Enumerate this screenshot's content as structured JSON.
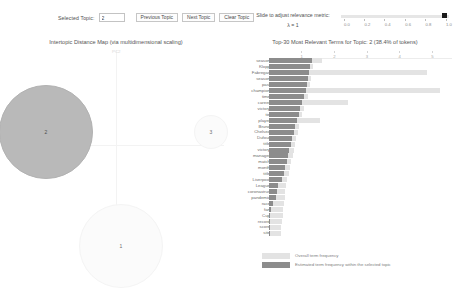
{
  "controls": {
    "selected_topic_label": "Selected Topic:",
    "selected_topic_value": "2",
    "previous_topic_label": "Previous Topic",
    "next_topic_label": "Next Topic",
    "clear_topic_label": "Clear Topic"
  },
  "lambda": {
    "title": "Slide to adjust relevance metric:",
    "value_label": "λ = 1",
    "ticks": [
      "0.0",
      "0.2",
      "0.4",
      "0.6",
      "0.8",
      "1.0"
    ],
    "handle_position": 1.0,
    "min": 0.0,
    "max": 1.0
  },
  "left_panel": {
    "title": "Intertopic Distance Map (via multidimensional scaling)",
    "axis_x_label": "PC1",
    "axis_y_label": "PC2",
    "topics": [
      {
        "id": "2",
        "x": 38,
        "y": 82,
        "r": 47,
        "selected": true
      },
      {
        "id": "1",
        "x": 113,
        "y": 196,
        "r": 42,
        "selected": false
      },
      {
        "id": "3",
        "x": 203,
        "y": 82,
        "r": 17,
        "selected": false
      }
    ]
  },
  "right_panel": {
    "title": "Top-30 Most Relevant Terms for Topic: 2 (38.4% of tokens)",
    "axis_ticks": [
      "1",
      "2",
      "3",
      "4",
      "5"
    ],
    "axis_max": 5.6,
    "legend": {
      "overall_label": "Overall term frequency",
      "topic_label": "Estimated term frequency within the selected topic",
      "overall_color": "#e3e3e3",
      "topic_color": "#8c8c8c"
    },
    "terms": [
      {
        "term": "season",
        "overall": 1.63,
        "topic": 1.32
      },
      {
        "term": "Klopp",
        "overall": 1.34,
        "topic": 1.26
      },
      {
        "term": "Fabregas",
        "overall": 4.84,
        "topic": 1.23
      },
      {
        "term": "season",
        "overall": 1.28,
        "topic": 1.19
      },
      {
        "term": "past",
        "overall": 1.25,
        "topic": 1.16
      },
      {
        "term": "champion",
        "overall": 5.22,
        "topic": 1.13
      },
      {
        "term": "time",
        "overall": 1.18,
        "topic": 1.06
      },
      {
        "term": "career",
        "overall": 2.42,
        "topic": 1.01
      },
      {
        "term": "victory",
        "overall": 1.07,
        "topic": 0.96
      },
      {
        "term": "tie",
        "overall": 1.02,
        "topic": 0.91
      },
      {
        "term": "player",
        "overall": 1.55,
        "topic": 0.86
      },
      {
        "term": "Bruno",
        "overall": 0.93,
        "topic": 0.8
      },
      {
        "term": "Chelsea",
        "overall": 0.88,
        "topic": 0.75
      },
      {
        "term": "Dufour",
        "overall": 0.84,
        "topic": 0.71
      },
      {
        "term": "title",
        "overall": 0.8,
        "topic": 0.66
      },
      {
        "term": "victory",
        "overall": 0.76,
        "topic": 0.62
      },
      {
        "term": "manager",
        "overall": 0.72,
        "topic": 0.58
      },
      {
        "term": "match",
        "overall": 0.68,
        "topic": 0.54
      },
      {
        "term": "month",
        "overall": 0.64,
        "topic": 0.5
      },
      {
        "term": "title",
        "overall": 0.6,
        "topic": 0.45
      },
      {
        "term": "Liverpool",
        "overall": 0.56,
        "topic": 0.4
      },
      {
        "term": "League",
        "overall": 0.52,
        "topic": 0.29
      },
      {
        "term": "coronavirus",
        "overall": 0.5,
        "topic": 0.24
      },
      {
        "term": "pandemic",
        "overall": 0.48,
        "topic": 0.2
      },
      {
        "term": "race",
        "overall": 0.46,
        "topic": 0.11
      },
      {
        "term": "fan",
        "overall": 0.44,
        "topic": 0.05
      },
      {
        "term": "Cup",
        "overall": 0.42,
        "topic": 0.04
      },
      {
        "term": "record",
        "overall": 0.4,
        "topic": 0.03
      },
      {
        "term": "score",
        "overall": 0.38,
        "topic": 0.02
      },
      {
        "term": "site",
        "overall": 0.36,
        "topic": 0.02
      }
    ]
  }
}
